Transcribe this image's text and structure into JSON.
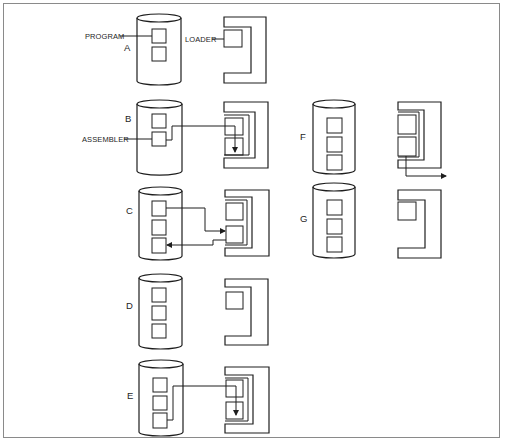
{
  "diagram": {
    "title": "",
    "callouts": {
      "program": "PROGRAM",
      "loader": "LOADER",
      "assembler": "ASSEMBLER"
    },
    "steps": [
      {
        "id": "A",
        "label": "A",
        "disk_blocks": 2,
        "loader_blocks": 1,
        "flow": "Program on disk; loader in memory"
      },
      {
        "id": "B",
        "label": "B",
        "disk_blocks": 2,
        "loader_blocks": 2,
        "flow": "Assembler (disk block 2) loaded into memory block 2"
      },
      {
        "id": "C",
        "label": "C",
        "disk_blocks": 3,
        "loader_blocks": 2,
        "flow": "Program (disk block 1) fed to assembler; output written to disk block 3"
      },
      {
        "id": "D",
        "label": "D",
        "disk_blocks": 3,
        "loader_blocks": 1,
        "flow": "Three blocks on disk; loader only in memory"
      },
      {
        "id": "E",
        "label": "E",
        "disk_blocks": 3,
        "loader_blocks": 2,
        "flow": "Assembled output (disk block 3) loaded into memory block 2"
      },
      {
        "id": "F",
        "label": "F",
        "disk_blocks": 3,
        "loader_blocks": 2,
        "flow": "Memory block 2 output sent out"
      },
      {
        "id": "G",
        "label": "G",
        "disk_blocks": 3,
        "loader_blocks": 1,
        "flow": "Final state"
      }
    ],
    "colors": {
      "line": "#1e1e1e",
      "frame": "#8a8a8a",
      "background": "#ffffff"
    }
  }
}
